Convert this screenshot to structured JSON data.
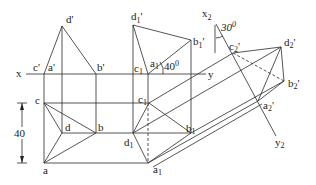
{
  "figure": {
    "labels": {
      "x": "x",
      "y": "y",
      "x2": "x",
      "x2_sub": "2",
      "y2": "y",
      "y2_sub": "2",
      "d_p": "d'",
      "c_p": "c'",
      "a_p": "a'",
      "b_p": "b'",
      "c": "c",
      "d": "d",
      "b": "b",
      "a": "a",
      "d1_p": "d",
      "c1_p": "c",
      "a1_p": "a",
      "b1_p": "b",
      "c1": "c",
      "d1": "d",
      "b1": "b",
      "a1": "a",
      "c2_p": "c",
      "d2_p": "d",
      "b2_p": "b",
      "a2_p": "a",
      "sub1": "1",
      "sub2": "2",
      "prime": "'"
    },
    "angle_40": "40",
    "angle_30": "30",
    "degree": "0",
    "dimension_40": "40"
  }
}
